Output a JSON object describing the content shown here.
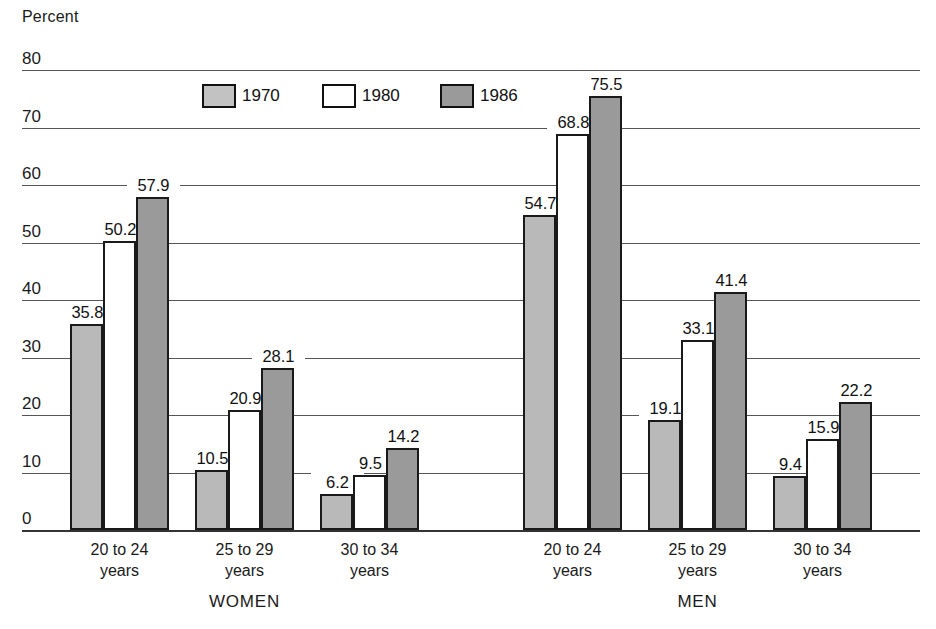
{
  "chart_data": {
    "type": "bar",
    "title": "",
    "ylabel": "Percent",
    "xlabel": "",
    "ylim": [
      0,
      80
    ],
    "ytick_labels": [
      "80",
      "70",
      "60",
      "50",
      "40",
      "30",
      "20",
      "10",
      "0"
    ],
    "ytick_values": [
      80,
      70,
      60,
      50,
      40,
      30,
      20,
      10,
      0
    ],
    "grid": true,
    "legend_position": "top-center",
    "legend": [
      "1970",
      "1980",
      "1986"
    ],
    "series": [
      {
        "name": "1970",
        "color": "#b9b9b9",
        "values": [
          35.8,
          10.5,
          6.2,
          54.7,
          19.1,
          9.4
        ]
      },
      {
        "name": "1980",
        "color": "#ffffff",
        "values": [
          50.2,
          20.9,
          9.5,
          68.8,
          33.1,
          15.9
        ]
      },
      {
        "name": "1986",
        "color": "#9a9a9a",
        "values": [
          57.9,
          28.1,
          14.2,
          75.5,
          41.4,
          22.2
        ]
      }
    ],
    "categories": [
      "20 to 24 years",
      "25 to 29 years",
      "30 to 34 years",
      "20 to 24 years",
      "25 to 29 years",
      "30 to 34 years"
    ],
    "panels": [
      {
        "label": "WOMEN",
        "groups": [
          {
            "line1": "20 to 24",
            "line2": "years",
            "bars": [
              {
                "series": "1970",
                "value": 35.8,
                "label": "35.8"
              },
              {
                "series": "1980",
                "value": 50.2,
                "label": "50.2"
              },
              {
                "series": "1986",
                "value": 57.9,
                "label": "57.9"
              }
            ]
          },
          {
            "line1": "25 to 29",
            "line2": "years",
            "bars": [
              {
                "series": "1970",
                "value": 10.5,
                "label": "10.5"
              },
              {
                "series": "1980",
                "value": 20.9,
                "label": "20.9"
              },
              {
                "series": "1986",
                "value": 28.1,
                "label": "28.1"
              }
            ]
          },
          {
            "line1": "30 to 34",
            "line2": "years",
            "bars": [
              {
                "series": "1970",
                "value": 6.2,
                "label": "6.2"
              },
              {
                "series": "1980",
                "value": 9.5,
                "label": "9.5"
              },
              {
                "series": "1986",
                "value": 14.2,
                "label": "14.2"
              }
            ]
          }
        ]
      },
      {
        "label": "MEN",
        "groups": [
          {
            "line1": "20 to 24",
            "line2": "years",
            "bars": [
              {
                "series": "1970",
                "value": 54.7,
                "label": "54.7"
              },
              {
                "series": "1980",
                "value": 68.8,
                "label": "68.8"
              },
              {
                "series": "1986",
                "value": 75.5,
                "label": "75.5"
              }
            ]
          },
          {
            "line1": "25 to 29",
            "line2": "years",
            "bars": [
              {
                "series": "1970",
                "value": 19.1,
                "label": "19.1"
              },
              {
                "series": "1980",
                "value": 33.1,
                "label": "33.1"
              },
              {
                "series": "1986",
                "value": 41.4,
                "label": "41.4"
              }
            ]
          },
          {
            "line1": "30 to 34",
            "line2": "years",
            "bars": [
              {
                "series": "1970",
                "value": 9.4,
                "label": "9.4"
              },
              {
                "series": "1980",
                "value": 15.9,
                "label": "15.9"
              },
              {
                "series": "1986",
                "value": 22.2,
                "label": "22.2"
              }
            ]
          }
        ]
      }
    ]
  }
}
